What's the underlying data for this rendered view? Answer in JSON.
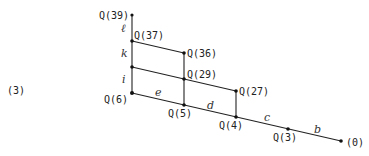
{
  "equation_number": "(3)",
  "nodes": {
    "q39": "Q(39)",
    "q37": "Q(37)",
    "q36": "Q(36)",
    "q29": "Q(29)",
    "q27": "Q(27)",
    "q6": "Q(6)",
    "q5": "Q(5)",
    "q4": "Q(4)",
    "q3": "Q(3)",
    "q0": "(0)"
  },
  "edge_labels": {
    "l": "ℓ",
    "k": "k",
    "i": "i",
    "e": "e",
    "d": "d",
    "c": "c",
    "b": "b"
  }
}
